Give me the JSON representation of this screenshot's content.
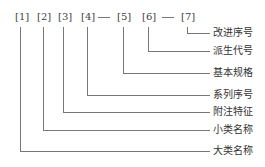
{
  "codes": [
    "[1]",
    "[2]",
    "[3]",
    "[4]",
    "[5]",
    "[6]",
    "[7]"
  ],
  "separators": [
    "—",
    "—"
  ],
  "labels": [
    "改进序号",
    "派生代号",
    "基本规格",
    "系列序号",
    "附注特征",
    "小类名称",
    "大类名称"
  ]
}
